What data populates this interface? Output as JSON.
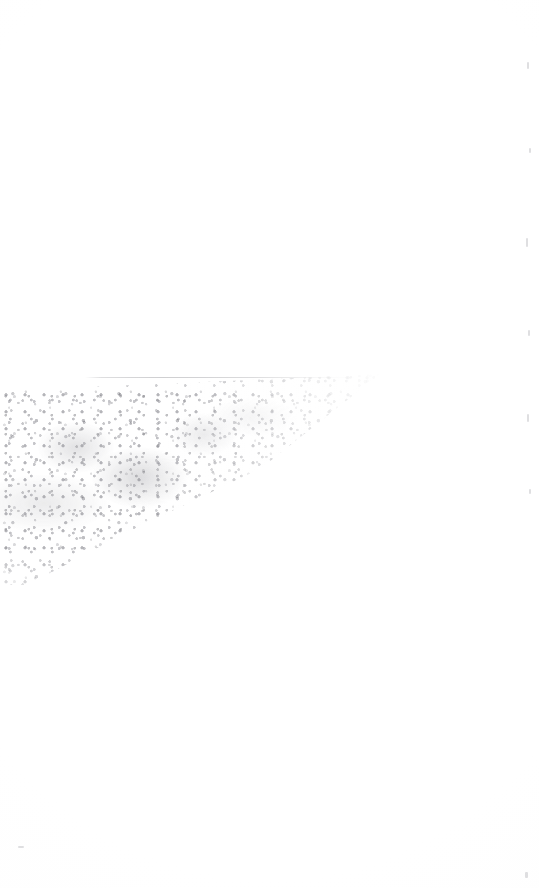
{
  "document": {
    "page_label": "",
    "visible_text": "",
    "description": "Near-blank scanned page: faint horizontal rule with a granular grey wedge-shaped smudge below-left",
    "background_color": "#ffffff",
    "ink_color": "#808086",
    "width_px": 539,
    "height_px": 888
  },
  "marks": {
    "rule": {
      "name": "faint-horizontal-rule",
      "x": 85,
      "y": 377,
      "width": 275,
      "height": 1,
      "color": "#84848a",
      "opacity": "0.40"
    },
    "smudge": {
      "name": "granular-wedge-smudge",
      "x": -20,
      "y": 370,
      "width": 400,
      "height": 215,
      "darkest_color": "#6e6e76",
      "average_color": "#c9c9ce",
      "shape": "wedge"
    },
    "specks": [
      {
        "x": 527,
        "y": 62,
        "w": 2,
        "h": 7
      },
      {
        "x": 529,
        "y": 148,
        "w": 2,
        "h": 5
      },
      {
        "x": 526,
        "y": 238,
        "w": 2,
        "h": 9
      },
      {
        "x": 528,
        "y": 330,
        "w": 2,
        "h": 6
      },
      {
        "x": 527,
        "y": 414,
        "w": 2,
        "h": 8
      },
      {
        "x": 529,
        "y": 489,
        "w": 2,
        "h": 5
      },
      {
        "x": 525,
        "y": 872,
        "w": 3,
        "h": 6
      },
      {
        "x": 18,
        "y": 846,
        "w": 6,
        "h": 2
      }
    ]
  }
}
